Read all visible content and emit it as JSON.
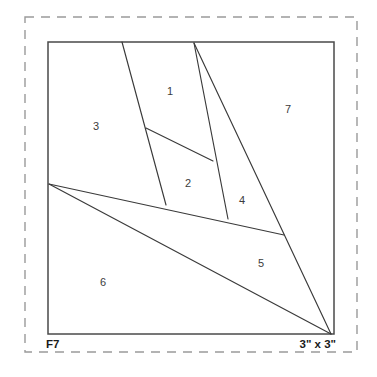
{
  "sheet": {
    "name": "foundation-piecing-pattern",
    "background_color": "#ffffff"
  },
  "colors": {
    "dashed_border": "#9a9a9a",
    "block_outline": "#4a4a4a",
    "seam_line": "#3a3a3a",
    "number_text": "#3c3c3c",
    "label_text": "#1a1a1a"
  },
  "labels": {
    "pattern_id": "F7",
    "size": "3\" x 3\""
  },
  "diagram": {
    "dashed_border": {
      "x": 25,
      "y": 17,
      "width": 332,
      "height": 335
    },
    "block": {
      "x": 48,
      "y": 42,
      "width": 286,
      "height": 292
    },
    "vertices": {
      "top_left": [
        48,
        42
      ],
      "top_mid_left": [
        122,
        42
      ],
      "top_mid_right": [
        194,
        43
      ],
      "top_right": [
        334,
        42
      ],
      "left_fan": [
        49,
        184
      ],
      "inner_upper": [
        146,
        128
      ],
      "inner_right": [
        213,
        161
      ],
      "line1_foot": [
        166,
        205
      ],
      "line2_foot": [
        228,
        219
      ],
      "diag_right": [
        284,
        235
      ],
      "bottom_right": [
        331,
        334
      ],
      "bottom_left": [
        48,
        334
      ]
    },
    "seams": [
      {
        "name": "seam-top-left-descender",
        "from": [
          122,
          42
        ],
        "to": [
          166,
          205
        ]
      },
      {
        "name": "seam-inner-crossbar",
        "from": [
          146,
          128
        ],
        "to": [
          213,
          161
        ]
      },
      {
        "name": "seam-center-descender",
        "from": [
          194,
          43
        ],
        "to": [
          228,
          219
        ]
      },
      {
        "name": "seam-long-right-diagonal",
        "from": [
          194,
          43
        ],
        "to": [
          331,
          334
        ]
      },
      {
        "name": "seam-upper-fan-diagonal",
        "from": [
          49,
          184
        ],
        "to": [
          284,
          235
        ]
      },
      {
        "name": "seam-lower-fan-diagonal",
        "from": [
          49,
          184
        ],
        "to": [
          331,
          334
        ]
      }
    ],
    "sections": [
      {
        "number": "1",
        "x": 170,
        "y": 92
      },
      {
        "number": "2",
        "x": 188,
        "y": 184
      },
      {
        "number": "3",
        "x": 96,
        "y": 127
      },
      {
        "number": "4",
        "x": 242,
        "y": 201
      },
      {
        "number": "5",
        "x": 261,
        "y": 264
      },
      {
        "number": "6",
        "x": 103,
        "y": 283
      },
      {
        "number": "7",
        "x": 288,
        "y": 110
      }
    ],
    "corner_labels": [
      {
        "name": "pattern-id-label",
        "text": "F7",
        "x": 46,
        "y": 348
      },
      {
        "name": "block-size-label",
        "text": "3\" x 3\"",
        "x": 336,
        "y": 348
      }
    ]
  }
}
